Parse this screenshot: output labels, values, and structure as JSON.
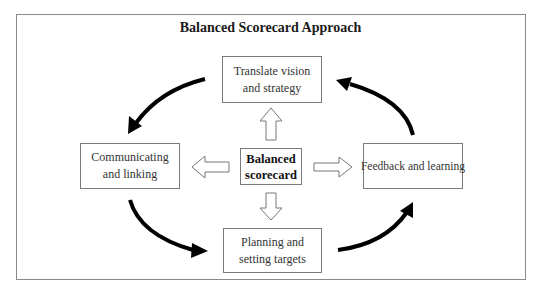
{
  "diagram": {
    "title": "Balanced Scorecard Approach",
    "center": {
      "line1": "Balanced",
      "line2": "scorecard"
    },
    "nodes": {
      "top": {
        "line1": "Translate vision",
        "line2": "and strategy"
      },
      "left": {
        "line1": "Communicating",
        "line2": "and linking"
      },
      "right": {
        "line1": "Feedback and learning"
      },
      "bottom": {
        "line1": "Planning and",
        "line2": "setting targets"
      }
    },
    "cycle_direction": "counter-clockwise: Translate vision → Communicating → Planning → Feedback → Translate vision",
    "colors": {
      "frame": "#8a8a8a",
      "box_border": "#7a7a7a",
      "arrow": "#000000",
      "text": "#333333"
    }
  }
}
